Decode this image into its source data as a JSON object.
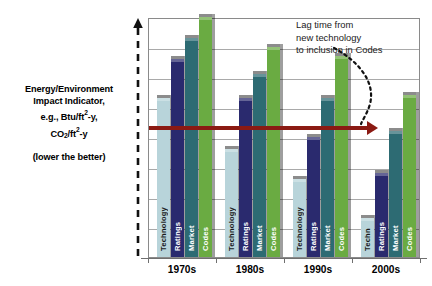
{
  "axis_caption": {
    "line1": "Energy/Environment",
    "line2": "Impact Indicator,",
    "line3_pre": "e.g., Btu/ft",
    "line3_sup": "2",
    "line3_post": "-y,",
    "line4_pre": "CO",
    "line4_sub": "2",
    "line4_post": "/ft",
    "line4_sup": "2",
    "line4_end": "-y",
    "note": "(lower the better)"
  },
  "annotation": {
    "line1": "Lag time from",
    "line2": "new technology",
    "line3": "to inclusion in Codes"
  },
  "colors": {
    "technology": "#b8d4da",
    "ratings": "#2a2a6e",
    "market": "#2d6b73",
    "codes": "#6aab42",
    "lag_arrow": "#8b1a13",
    "gridline": "#a9a9a9",
    "frame": "#8a8a8a"
  },
  "chart_data": {
    "type": "bar",
    "title": "",
    "xlabel": "",
    "ylabel": "Energy/Environment Impact Indicator, e.g., Btu/ft2-y, CO2/ft2-y",
    "ylim": [
      0,
      8
    ],
    "grid": true,
    "legend": "none",
    "y_tick_labels": [],
    "categories": [
      "1970s",
      "1980s",
      "1990s",
      "2000s"
    ],
    "series": [
      {
        "name": "Technology",
        "color": "#b8d4da",
        "values": [
          5.3,
          3.6,
          2.6,
          1.3
        ],
        "bar_labels": [
          "Technology",
          "Technology",
          "Technology",
          "Techn"
        ]
      },
      {
        "name": "Ratings",
        "color": "#2a2a6e",
        "values": [
          6.6,
          5.3,
          4.0,
          2.8
        ],
        "bar_labels": [
          "Ratings",
          "Ratings",
          "Ratings",
          "Ratings"
        ]
      },
      {
        "name": "Market",
        "color": "#2d6b73",
        "values": [
          7.3,
          6.1,
          5.3,
          4.2
        ],
        "bar_labels": [
          "Market",
          "Market",
          "Market",
          "Market"
        ]
      },
      {
        "name": "Codes",
        "color": "#6aab42",
        "values": [
          8.0,
          7.0,
          6.7,
          5.4
        ],
        "bar_labels": [
          "Codes",
          "Codes",
          "Codes",
          "Codes"
        ]
      }
    ],
    "annotations": [
      {
        "type": "arrow",
        "text": "Lag time from new technology to inclusion in Codes",
        "orientation": "horizontal",
        "y_value": 5.4,
        "from_category": "1970s",
        "to_category": "2000s"
      }
    ]
  }
}
